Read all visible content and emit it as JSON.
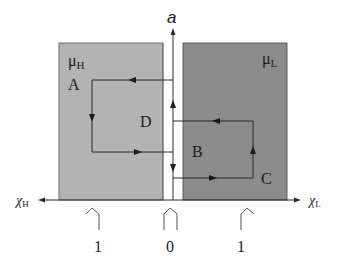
{
  "diagram": {
    "vertical_axis_label": "a",
    "horizontal_axis_left_label": "χ",
    "horizontal_axis_left_sub": "H",
    "horizontal_axis_right_label": "χ",
    "horizontal_axis_right_sub": "L",
    "left_region": {
      "label": "μ",
      "sub": "H",
      "color": "#b3b3b3"
    },
    "right_region": {
      "label": "μ",
      "sub": "L",
      "color": "#8c8c8c"
    },
    "points": {
      "A": "A",
      "B": "B",
      "C": "C",
      "D": "D"
    },
    "ticks": [
      {
        "label": "1",
        "position": "left"
      },
      {
        "label": "0",
        "position": "center"
      },
      {
        "label": "1",
        "position": "right"
      }
    ],
    "line_color": "#2a2a2a"
  }
}
